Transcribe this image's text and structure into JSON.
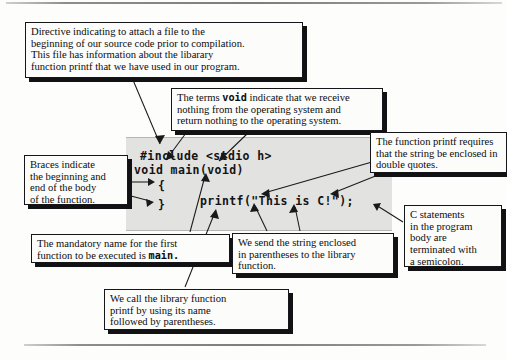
{
  "figure": {
    "code_panel": {
      "lines": [
        {
          "name": "include-directive",
          "text": "#include <stdio h>"
        },
        {
          "name": "function-signature",
          "text": "void main(void)"
        },
        {
          "name": "open-brace",
          "text": "{"
        },
        {
          "name": "printf-statement",
          "text": "printf(\"This is C!\");"
        },
        {
          "name": "close-brace",
          "text": "}"
        }
      ]
    },
    "callouts": [
      {
        "id": "directive",
        "lines": [
          "Directive indicating to attach a file to the",
          "beginning of our source code prior to compilation.",
          "This file has information about the libarary",
          "function printf that we have used in our program."
        ]
      },
      {
        "id": "void",
        "pre_1": "The terms ",
        "mono_1": "void",
        "post_1": " indicate that we receive",
        "lines": [
          "nothing from the operating system and",
          "return nothing to the operating system."
        ]
      },
      {
        "id": "braces",
        "lines": [
          "Braces indicate",
          "the beginning and",
          "end of the body",
          "of the function."
        ]
      },
      {
        "id": "printf-quotes",
        "lines": [
          "The function printf requires",
          "that the string be enclosed in",
          "double quotes."
        ]
      },
      {
        "id": "semicolon",
        "lines": [
          "C statements",
          "in the program",
          "body are",
          "terminated with",
          "a semicolon."
        ]
      },
      {
        "id": "main-name",
        "line_1": "The mandatory name for the first",
        "pre_2": "function to be executed is ",
        "mono_2": "main."
      },
      {
        "id": "parens",
        "lines": [
          "We send the string enclosed",
          "in parentheses to the library",
          "function."
        ]
      },
      {
        "id": "call",
        "lines": [
          "We call the library function",
          "printf by using its name",
          "followed by parentheses."
        ]
      }
    ]
  },
  "colors": {
    "panel_fill": "#e2e2e0",
    "callout_fill": "#fcfcfb",
    "ink": "#15151a",
    "shadow": "#121214"
  }
}
